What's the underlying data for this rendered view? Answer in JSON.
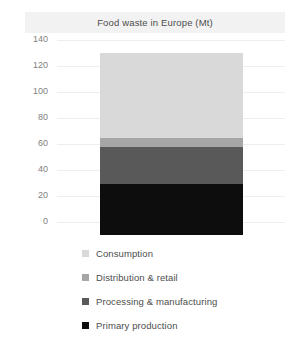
{
  "header": {
    "title": "Food waste in Europe (Mt)"
  },
  "chart_data": {
    "type": "bar",
    "title": "Food waste in Europe (Mt)",
    "subtitle": "",
    "xlabel": "",
    "ylabel": "",
    "categories": [
      "Europe"
    ],
    "stacked": true,
    "orientation": "vertical",
    "ylim": [
      0,
      140
    ],
    "yticks": [
      0,
      20,
      40,
      60,
      80,
      100,
      120,
      140
    ],
    "ytick_labels": [
      "0",
      "20",
      "40",
      "60",
      "80",
      "100",
      "120",
      "140"
    ],
    "grid": true,
    "grid_axis": "y",
    "legend_position": "bottom-left",
    "total": 131,
    "units": "Mt",
    "series": [
      {
        "name": "Consumption",
        "values": [
          65
        ],
        "color": "#d9d9d9"
      },
      {
        "name": "Distribution & retail",
        "values": [
          7
        ],
        "color": "#a6a6a6"
      },
      {
        "name": "Processing & manufacturing",
        "values": [
          29
        ],
        "color": "#595959"
      },
      {
        "name": "Primary production",
        "values": [
          39
        ],
        "color": "#0d0d0d"
      }
    ]
  },
  "legend": {
    "items": [
      {
        "label": "Consumption",
        "color": "#d9d9d9"
      },
      {
        "label": "Distribution & retail",
        "color": "#a6a6a6"
      },
      {
        "label": "Processing & manufacturing",
        "color": "#595959"
      },
      {
        "label": "Primary production",
        "color": "#0d0d0d"
      }
    ]
  },
  "colors": {
    "title_band": "#f2f2f2",
    "gridline": "#eeeeee",
    "tick_text": "#808080",
    "label_text": "#4d4d4d",
    "background": "#ffffff"
  }
}
